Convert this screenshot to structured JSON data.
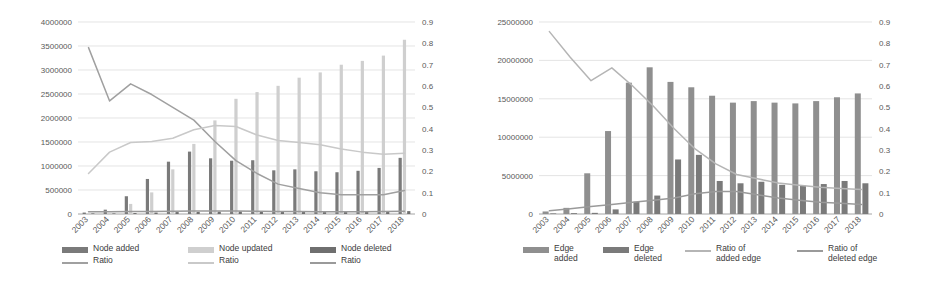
{
  "figure": {
    "background": "#ffffff",
    "colors": {
      "series_dark": "#7a7a7a",
      "series_light": "#b9b9b9",
      "series_mid": "#8f8f8f",
      "line_dark": "#a0a0a0",
      "line_light": "#c9c9c9",
      "grid": "#d9d9d9",
      "axis_text": "#595959"
    }
  },
  "panels": [
    {
      "id": "node-panel",
      "legend": [
        {
          "type": "bar",
          "label": "Node added",
          "color": "#7a7a7a"
        },
        {
          "type": "line",
          "label": "Ratio",
          "color": "#a0a0a0"
        },
        {
          "type": "bar",
          "label": "Node updated",
          "color": "#cfcfcf"
        },
        {
          "type": "line",
          "label": "Ratio",
          "color": "#c9c9c9"
        },
        {
          "type": "bar",
          "label": "Node deleted",
          "color": "#6f6f6f"
        },
        {
          "type": "line",
          "label": "Ratio",
          "color": "#9a9a9a"
        }
      ],
      "chart_data": {
        "type": "bar",
        "title": "",
        "xlabel": "",
        "ylabel": "",
        "grid": true,
        "legend_position": "bottom",
        "categories": [
          "2003",
          "2004",
          "2005",
          "2006",
          "2007",
          "2008",
          "2009",
          "2010",
          "2011",
          "2012",
          "2013",
          "2014",
          "2015",
          "2016",
          "2017",
          "2018"
        ],
        "y_left": {
          "ticks": [
            0,
            500000,
            1000000,
            1500000,
            2000000,
            2500000,
            3000000,
            3500000,
            4000000
          ],
          "tick_labels": [
            "0",
            "500000",
            "1000000",
            "1500000",
            "2000000",
            "2500000",
            "3000000",
            "3500000",
            "4000000"
          ],
          "ylim": [
            0,
            4000000
          ]
        },
        "y_right": {
          "ticks": [
            0,
            0.1,
            0.2,
            0.3,
            0.4,
            0.5,
            0.6,
            0.7,
            0.8,
            0.9
          ],
          "tick_labels": [
            "0",
            "0.1",
            "0.2",
            "0.3",
            "0.4",
            "0.5",
            "0.6",
            "0.7",
            "0.8",
            "0.9"
          ],
          "ylim": [
            0,
            0.9
          ]
        },
        "bar_series": [
          {
            "name": "Node added",
            "axis": "left",
            "color": "#7a7a7a",
            "values": [
              30000,
              90000,
              370000,
              730000,
              1090000,
              1300000,
              1160000,
              1110000,
              1120000,
              910000,
              930000,
              890000,
              870000,
              900000,
              960000,
              1170000
            ]
          },
          {
            "name": "Node updated",
            "axis": "left",
            "color": "#cfcfcf",
            "values": [
              10000,
              20000,
              210000,
              450000,
              930000,
              1460000,
              1950000,
              2400000,
              2540000,
              2670000,
              2840000,
              2950000,
              3110000,
              3190000,
              3300000,
              3630000
            ]
          },
          {
            "name": "Node deleted",
            "axis": "left",
            "color": "#6f6f6f",
            "values": [
              5000,
              8000,
              20000,
              30000,
              40000,
              45000,
              50000,
              55000,
              50000,
              45000,
              45000,
              40000,
              40000,
              42000,
              45000,
              60000
            ]
          }
        ],
        "line_series": [
          {
            "name": "Ratio of added node",
            "axis": "right",
            "color": "#a0a0a0",
            "values": [
              0.78,
              0.53,
              0.61,
              0.56,
              0.5,
              0.44,
              0.34,
              0.25,
              0.19,
              0.14,
              0.12,
              0.1,
              0.09,
              0.09,
              0.09,
              0.11
            ]
          },
          {
            "name": "Ratio of updated node",
            "axis": "right",
            "color": "#c9c9c9",
            "values": [
              0.19,
              0.29,
              0.335,
              0.34,
              0.355,
              0.395,
              0.415,
              0.41,
              0.37,
              0.345,
              0.335,
              0.325,
              0.305,
              0.29,
              0.28,
              0.285
            ]
          },
          {
            "name": "Ratio of deleted node",
            "axis": "right",
            "color": "#9a9a9a",
            "values": [
              0.01,
              0.01,
              0.012,
              0.012,
              0.013,
              0.014,
              0.014,
              0.014,
              0.013,
              0.012,
              0.012,
              0.011,
              0.011,
              0.011,
              0.012,
              0.013
            ]
          }
        ]
      }
    },
    {
      "id": "edge-panel",
      "legend": [
        {
          "type": "bar",
          "label": "Edge\nadded",
          "color": "#8f8f8f"
        },
        {
          "type": "bar",
          "label": "Edge\ndeleted",
          "color": "#7a7a7a"
        },
        {
          "type": "line",
          "label": "Ratio of\nadded edge",
          "color": "#b5b5b5"
        },
        {
          "type": "line",
          "label": "Ratio of\ndeleted edge",
          "color": "#9a9a9a"
        }
      ],
      "chart_data": {
        "type": "bar",
        "title": "",
        "xlabel": "",
        "ylabel": "",
        "grid": true,
        "legend_position": "bottom",
        "categories": [
          "2003",
          "2004",
          "2005",
          "2006",
          "2007",
          "2008",
          "2009",
          "2010",
          "2011",
          "2012",
          "2013",
          "2014",
          "2015",
          "2016",
          "2017",
          "2018"
        ],
        "y_left": {
          "ticks": [
            0,
            5000000,
            10000000,
            15000000,
            20000000,
            25000000
          ],
          "tick_labels": [
            "0",
            "5000000",
            "10000000",
            "15000000",
            "20000000",
            "25000000"
          ],
          "ylim": [
            0,
            25000000
          ]
        },
        "y_right": {
          "ticks": [
            0,
            0.1,
            0.2,
            0.3,
            0.4,
            0.5,
            0.6,
            0.7,
            0.8,
            0.9
          ],
          "tick_labels": [
            "0",
            "0.1",
            "0.2",
            "0.3",
            "0.4",
            "0.5",
            "0.6",
            "0.7",
            "0.8",
            "0.9"
          ],
          "ylim": [
            0,
            0.9
          ]
        },
        "bar_series": [
          {
            "name": "Edge added",
            "axis": "left",
            "color": "#8f8f8f",
            "values": [
              330000,
              800000,
              5300000,
              10800000,
              17100000,
              19100000,
              17200000,
              16500000,
              15400000,
              14500000,
              14700000,
              14500000,
              14400000,
              14700000,
              15200000,
              15700000
            ]
          },
          {
            "name": "Edge deleted",
            "axis": "left",
            "color": "#7a7a7a",
            "values": [
              60000,
              110000,
              150000,
              600000,
              1600000,
              2400000,
              7100000,
              7700000,
              4300000,
              4000000,
              4200000,
              3800000,
              3700000,
              3900000,
              4300000,
              4000000
            ]
          }
        ],
        "line_series": [
          {
            "name": "Ratio of added edge",
            "axis": "right",
            "color": "#b5b5b5",
            "values": [
              0.855,
              0.735,
              0.625,
              0.685,
              0.6,
              0.505,
              0.4,
              0.305,
              0.235,
              0.185,
              0.165,
              0.145,
              0.135,
              0.125,
              0.12,
              0.115
            ]
          },
          {
            "name": "Ratio of deleted edge",
            "axis": "right",
            "color": "#9a9a9a",
            "values": [
              0.015,
              0.025,
              0.035,
              0.045,
              0.055,
              0.065,
              0.075,
              0.095,
              0.105,
              0.105,
              0.09,
              0.075,
              0.065,
              0.055,
              0.05,
              0.045
            ]
          }
        ]
      }
    }
  ]
}
